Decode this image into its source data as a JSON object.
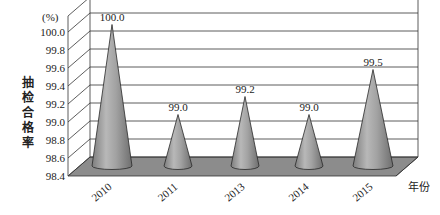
{
  "chart_data": {
    "type": "bar",
    "style": "3d-cone",
    "title": "",
    "xlabel": "年份",
    "ylabel": "抽检合格率",
    "yunit": "(%)",
    "categories": [
      "2010",
      "2011",
      "2013",
      "2014",
      "2015"
    ],
    "values": [
      100.0,
      99.0,
      99.2,
      99.0,
      99.5
    ],
    "data_labels": [
      "100.0",
      "99.0",
      "99.2",
      "99.0",
      "99.5"
    ],
    "ylim": [
      98.4,
      100.0
    ],
    "yticks": [
      "98.4",
      "98.6",
      "98.8",
      "99.0",
      "99.2",
      "99.4",
      "99.6",
      "99.8",
      "100.0"
    ],
    "grid": true,
    "legend": null,
    "colors": {
      "cone": "#9a9a9a",
      "floor": "#8c8c8c",
      "grid": "#333333"
    }
  },
  "labels": {
    "ylabel_chars": [
      "抽",
      "检",
      "合",
      "格",
      "率"
    ],
    "xunit": "年份",
    "yunit": "(%)"
  }
}
